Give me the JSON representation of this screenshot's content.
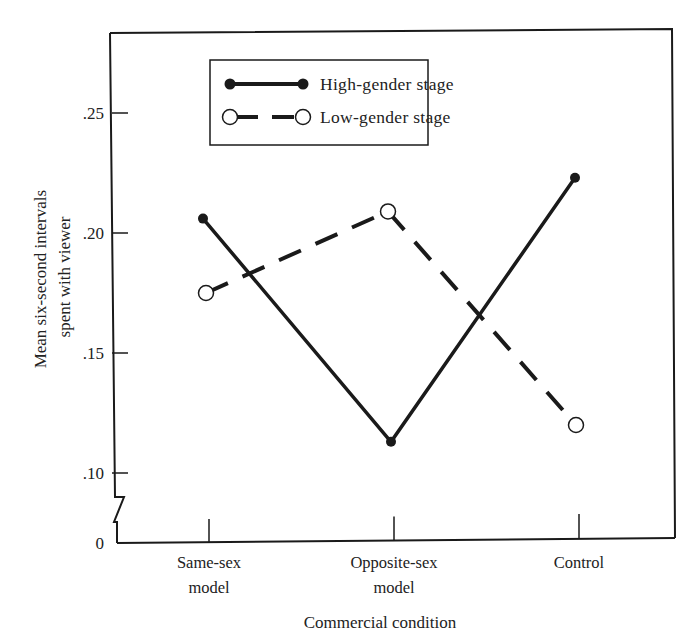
{
  "chart_data": {
    "type": "line",
    "title": "",
    "xlabel": "Commercial condition",
    "ylabel": "Mean six-second intervals spent with viewer",
    "ylabel_lines": [
      "Mean six-second intervals",
      "spent with viewer"
    ],
    "categories": [
      "Same-sex model",
      "Opposite-sex model",
      "Control"
    ],
    "category_label_lines": [
      [
        "Same-sex",
        "model"
      ],
      [
        "Opposite-sex",
        "model"
      ],
      [
        "Control"
      ]
    ],
    "series": [
      {
        "name": "High-gender stage",
        "style": "solid",
        "marker": "filled-circle",
        "values": [
          0.206,
          0.113,
          0.223
        ]
      },
      {
        "name": "Low-gender stage",
        "style": "dashed",
        "marker": "open-circle",
        "values": [
          0.175,
          0.209,
          0.12
        ]
      }
    ],
    "yticks": [
      0,
      0.1,
      0.15,
      0.2,
      0.25
    ],
    "ytick_labels": [
      "0",
      ".10",
      ".15",
      ".20",
      ".25"
    ],
    "ylim": [
      0.07,
      0.28
    ],
    "axis_break": true,
    "grid": false,
    "legend_position": "top-center (inside plot)"
  },
  "colors": {
    "ink": "#1a1a1a",
    "background": "#ffffff"
  }
}
